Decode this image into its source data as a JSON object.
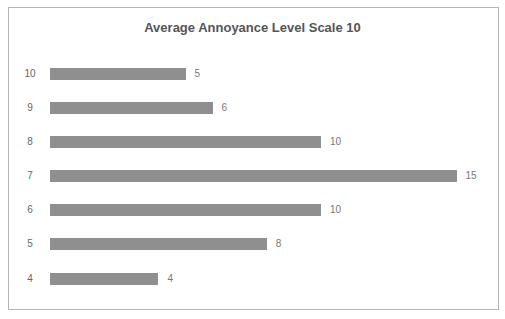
{
  "chart_data": {
    "type": "bar",
    "orientation": "horizontal",
    "title": "Average Annoyance Level Scale 10",
    "xlabel": "",
    "ylabel": "",
    "categories": [
      "10",
      "9",
      "8",
      "7",
      "6",
      "5",
      "4"
    ],
    "values": [
      5,
      6,
      10,
      15,
      10,
      8,
      4
    ],
    "bar_color": "#8f8f8f",
    "grid": false,
    "legend": null,
    "data_labels": true
  }
}
